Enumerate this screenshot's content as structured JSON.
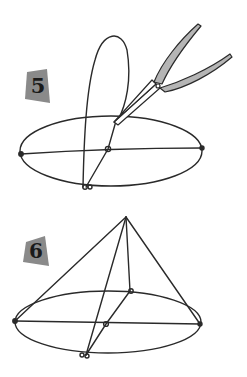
{
  "figure": {
    "steps": [
      {
        "label": "5",
        "description": "Wire ellipse with a vertical loop; pliers twisting the wire at the top crossing point"
      },
      {
        "label": "6",
        "description": "Wire bent upward into a cone over the ellipse base"
      }
    ],
    "colors": {
      "line": "#2a2a2a",
      "badge_fill": "#8a8a8a",
      "pliers_fill": "#b5b5b5",
      "background": "#ffffff"
    }
  }
}
